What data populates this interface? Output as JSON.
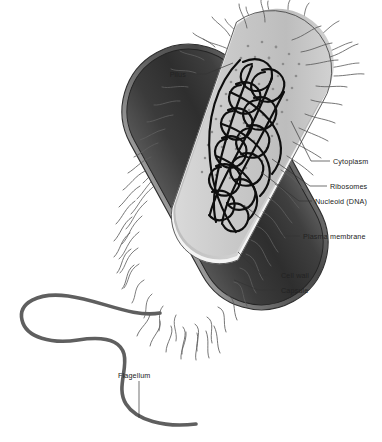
{
  "figure": {
    "organism": "rod-shaped bacterium (bacillus), cutaway view",
    "background_color": "#ffffff"
  },
  "labels": [
    {
      "id": "pilus",
      "text": "Pilus",
      "side": "left",
      "x": 166,
      "y": 76,
      "leader_to_x": 218,
      "leader_to_y": 66
    },
    {
      "id": "cytoplasm",
      "text": "Cytoplasm",
      "side": "right",
      "x": 333,
      "y": 163,
      "leader_to_x": 289,
      "leader_to_y": 123
    },
    {
      "id": "ribosomes",
      "text": "Ribosomes",
      "side": "right",
      "x": 330,
      "y": 188,
      "leader_to_x": 276,
      "leader_to_y": 160
    },
    {
      "id": "nucleoid",
      "text": "Nucleoid (DNA)",
      "side": "right",
      "x": 315,
      "y": 204,
      "leader_to_x": 265,
      "leader_to_y": 171
    },
    {
      "id": "plasma-membrane",
      "text": "Plasma membrane",
      "side": "right",
      "x": 303,
      "y": 239,
      "leader_to_x": 243,
      "leader_to_y": 206
    },
    {
      "id": "cell-wall",
      "text": "Cell wall",
      "side": "right",
      "x": 281,
      "y": 278,
      "leader_to_x": 240,
      "leader_to_y": 253
    },
    {
      "id": "capsule",
      "text": "Capsule",
      "side": "right",
      "x": 281,
      "y": 293,
      "leader_to_x": 236,
      "leader_to_y": 281
    },
    {
      "id": "flagellum",
      "text": "Flagellum",
      "side": "below",
      "x": 121,
      "y": 375,
      "leader_to_x": 140,
      "leader_to_y": 418
    }
  ],
  "structures": {
    "capsule": {
      "name": "Capsule",
      "color": "#6e6e6e",
      "description": "outer fuzzy gray coat surrounding the cell"
    },
    "cell_wall": {
      "name": "Cell wall",
      "color": "#3a3a3a",
      "description": "thick dark rigid layer beneath the capsule"
    },
    "plasma_membrane": {
      "name": "Plasma membrane",
      "color": "#f2f2f2",
      "description": "thin light line just inside the cell wall"
    },
    "cytoplasm": {
      "name": "Cytoplasm",
      "color": "#c6c6c6",
      "description": "light gray interior filling the cell"
    },
    "ribosomes": {
      "name": "Ribosomes",
      "color": "#8a8a8a",
      "description": "small dark dots scattered through the cytoplasm",
      "count": 52
    },
    "nucleoid": {
      "name": "Nucleoid (DNA)",
      "color": "#0d0d0d",
      "description": "dense tangled black loop of circular chromosome"
    },
    "pili": {
      "name": "Pilus",
      "color": "#5a5a5a",
      "description": "many thin hair-like projections radiating from the surface",
      "count": 68
    },
    "flagellum": {
      "name": "Flagellum",
      "color": "#5f5f5f",
      "description": "single long thick wavy tail extending from the lower-left pole"
    }
  },
  "colors": {
    "outline": "#2a2a2a",
    "label_text": "#222222",
    "leader_line": "#333333"
  }
}
